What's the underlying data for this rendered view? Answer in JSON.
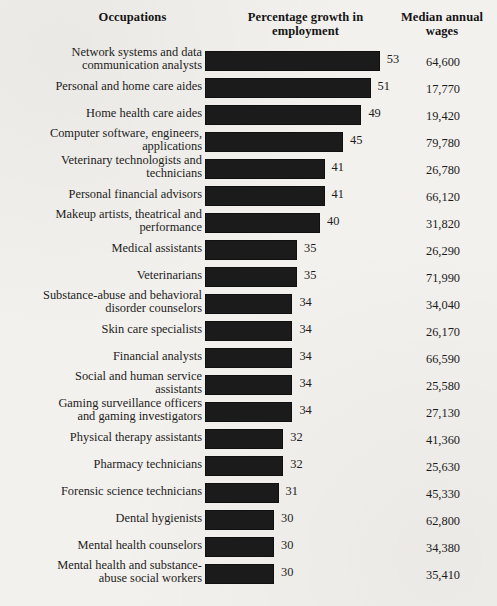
{
  "header": {
    "occupations": "Occupations",
    "growth": "Percentage growth in employment",
    "wages": "Median annual wages"
  },
  "chart_data": {
    "type": "bar",
    "title": "",
    "xlabel": "Percentage growth in employment",
    "ylabel": "Occupations",
    "orientation": "horizontal",
    "grid": false,
    "legend": false,
    "value_suffix": "",
    "xlim": [
      29,
      54
    ],
    "categories": [
      "Network systems and data communication analysts",
      "Personal and home care aides",
      "Home health care aides",
      "Computer software, engineers, applications",
      "Veterinary technologists and technicians",
      "Personal financial advisors",
      "Makeup artists, theatrical and performance",
      "Medical assistants",
      "Veterinarians",
      "Substance-abuse and behavioral disorder counselors",
      "Skin care specialists",
      "Financial analysts",
      "Social and human service assistants",
      "Gaming surveillance officers and gaming investigators",
      "Physical therapy assistants",
      "Pharmacy technicians",
      "Forensic science technicians",
      "Dental hygienists",
      "Mental health counselors",
      "Mental health and substance-abuse social workers"
    ],
    "values": [
      53,
      51,
      49,
      45,
      41,
      41,
      40,
      35,
      35,
      34,
      34,
      34,
      34,
      34,
      32,
      32,
      31,
      30,
      30,
      30
    ],
    "series": [
      {
        "name": "Median annual wages",
        "values": [
          64600,
          17770,
          19420,
          79780,
          26780,
          66120,
          31820,
          26290,
          71990,
          34040,
          26170,
          66590,
          25580,
          27130,
          41360,
          25630,
          45330,
          62800,
          34380,
          35410
        ]
      }
    ]
  },
  "rows": [
    {
      "label": "Network systems and data\ncommunication analysts",
      "lines": 2,
      "value": "53",
      "wage": "64,600"
    },
    {
      "label": "Personal and home care aides",
      "lines": 1,
      "value": "51",
      "wage": "17,770"
    },
    {
      "label": "Home health care aides",
      "lines": 1,
      "value": "49",
      "wage": "19,420"
    },
    {
      "label": "Computer software, engineers,\napplications",
      "lines": 2,
      "value": "45",
      "wage": "79,780"
    },
    {
      "label": "Veterinary technologists and\ntechnicians",
      "lines": 2,
      "value": "41",
      "wage": "26,780"
    },
    {
      "label": "Personal financial advisors",
      "lines": 1,
      "value": "41",
      "wage": "66,120"
    },
    {
      "label": "Makeup artists, theatrical and\nperformance",
      "lines": 2,
      "value": "40",
      "wage": "31,820"
    },
    {
      "label": "Medical assistants",
      "lines": 1,
      "value": "35",
      "wage": "26,290"
    },
    {
      "label": "Veterinarians",
      "lines": 1,
      "value": "35",
      "wage": "71,990"
    },
    {
      "label": "Substance-abuse and behavioral\ndisorder counselors",
      "lines": 2,
      "value": "34",
      "wage": "34,040"
    },
    {
      "label": "Skin care specialists",
      "lines": 1,
      "value": "34",
      "wage": "26,170"
    },
    {
      "label": "Financial analysts",
      "lines": 1,
      "value": "34",
      "wage": "66,590"
    },
    {
      "label": "Social and human service\nassistants",
      "lines": 2,
      "value": "34",
      "wage": "25,580"
    },
    {
      "label": "Gaming surveillance officers\nand gaming investigators",
      "lines": 2,
      "value": "34",
      "wage": "27,130"
    },
    {
      "label": "Physical therapy assistants",
      "lines": 1,
      "value": "32",
      "wage": "41,360"
    },
    {
      "label": "Pharmacy technicians",
      "lines": 1,
      "value": "32",
      "wage": "25,630"
    },
    {
      "label": "Forensic science technicians",
      "lines": 1,
      "value": "31",
      "wage": "45,330"
    },
    {
      "label": "Dental hygienists",
      "lines": 1,
      "value": "30",
      "wage": "62,800"
    },
    {
      "label": "Mental health counselors",
      "lines": 1,
      "value": "30",
      "wage": "34,380"
    },
    {
      "label": "Mental health and substance-\nabuse social workers",
      "lines": 2,
      "value": "30",
      "wage": "35,410"
    }
  ],
  "style": {
    "bar_color": "#1b1b1b",
    "page_color": "#f3f1ed",
    "text_color": "#1c1c1c"
  }
}
